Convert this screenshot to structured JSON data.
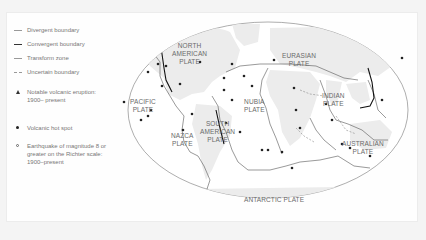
{
  "legend": {
    "items": [
      {
        "symbol": "thin-line",
        "label": "Divergent boundary"
      },
      {
        "symbol": "thick-line",
        "label": "Convergent boundary"
      },
      {
        "symbol": "thin-line",
        "label": "Transform zone"
      },
      {
        "symbol": "dashed-line",
        "label": "Uncertain boundary"
      },
      {
        "symbol": "triangle",
        "label": "Notable volcanic eruption: 1900– present"
      },
      {
        "symbol": "dot",
        "label": "Volcanic hot spot"
      },
      {
        "symbol": "open-circle",
        "label": "Earthquake of magnitude 8 or greater on the Richter scale: 1900–present"
      }
    ]
  },
  "map": {
    "plates": [
      {
        "id": "north-american",
        "line1": "NORTH",
        "line2": "AMERICAN",
        "line3": "PLATE"
      },
      {
        "id": "eurasian",
        "line1": "EURASIAN",
        "line2": "PLATE"
      },
      {
        "id": "pacific",
        "line1": "PACIFIC",
        "line2": "PLATE"
      },
      {
        "id": "nubia",
        "line1": "NUBIA",
        "line2": "PLATE"
      },
      {
        "id": "indian",
        "line1": "INDIAN",
        "line2": "PLATE"
      },
      {
        "id": "nazca",
        "line1": "NAZCA",
        "line2": "PLATE"
      },
      {
        "id": "south-american",
        "line1": "SOUTH",
        "line2": "AMERICAN",
        "line3": "PLATE"
      },
      {
        "id": "australian",
        "line1": "AUSTRALIAN",
        "line2": "PLATE"
      },
      {
        "id": "antarctic",
        "line1": "ANTARCTIC PLATE"
      }
    ]
  },
  "colors": {
    "background": "#f4f4f4",
    "panel": "#fefefe",
    "land": "#ececec",
    "boundary": "#555555",
    "text": "#6a6a6a"
  }
}
